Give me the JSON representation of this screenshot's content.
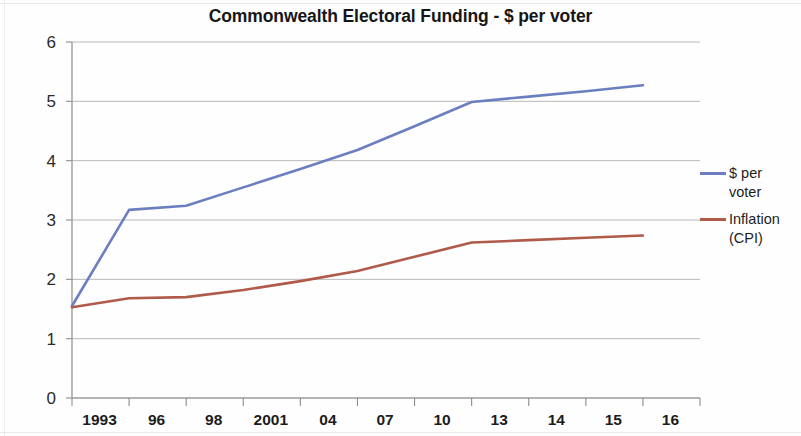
{
  "chart_data": {
    "type": "line",
    "title": "Commonwealth Electoral Funding - $ per voter",
    "xlabel": "",
    "ylabel": "",
    "categories": [
      "1993",
      "96",
      "98",
      "2001",
      "04",
      "07",
      "10",
      "13",
      "14",
      "15",
      "16"
    ],
    "series": [
      {
        "name": "$ per voter",
        "color": "#6b7fc0",
        "values": [
          1.55,
          3.17,
          3.24,
          3.55,
          3.86,
          4.18,
          4.58,
          4.99,
          5.08,
          5.17,
          5.27
        ]
      },
      {
        "name": "Inflation (CPI)",
        "color": "#b05a4a",
        "values": [
          1.53,
          1.68,
          1.7,
          1.82,
          1.97,
          2.14,
          2.38,
          2.62,
          2.66,
          2.7,
          2.74
        ]
      }
    ],
    "ylim": [
      0,
      6
    ],
    "yticks": [
      0,
      1,
      2,
      3,
      4,
      5,
      6
    ],
    "ytick_labels": [
      "0",
      "1",
      "2",
      "3",
      "4",
      "5",
      "6"
    ],
    "grid": true,
    "grid_axis": "y",
    "legend_position": "right",
    "legend": [
      {
        "label": "$ per\nvoter",
        "color": "#6b7fc0"
      },
      {
        "label": "Inflation\n(CPI)",
        "color": "#b05a4a"
      }
    ]
  },
  "chart": {
    "title": "Commonwealth Electoral Funding - $ per voter"
  }
}
